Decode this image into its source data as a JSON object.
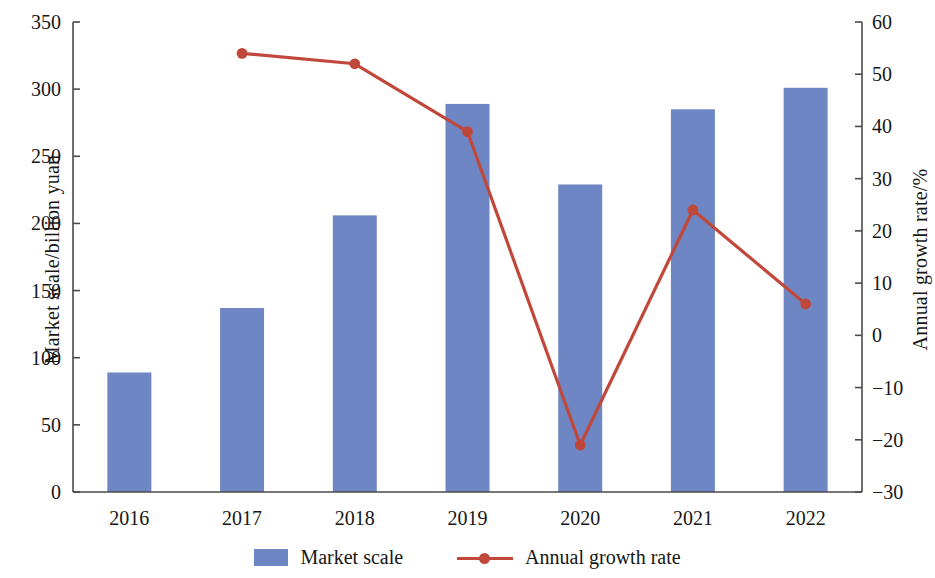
{
  "chart_data": {
    "type": "bar",
    "title": "",
    "subtitle": "",
    "categories": [
      "2016",
      "2017",
      "2018",
      "2019",
      "2020",
      "2021",
      "2022"
    ],
    "xlabel": "",
    "series": [
      {
        "name": "Market scale",
        "type": "bar",
        "axis": "left",
        "color": "#6f86c4",
        "values": [
          89,
          137,
          206,
          289,
          229,
          285,
          301
        ]
      },
      {
        "name": "Annual growth rate",
        "type": "line",
        "axis": "right",
        "color": "#c0483a",
        "values": [
          null,
          54,
          52,
          39,
          -21,
          24,
          6
        ]
      }
    ],
    "left_axis": {
      "label": "Market scale/billion yuan",
      "ticks": [
        "0",
        "50",
        "100",
        "150",
        "200",
        "250",
        "300",
        "350"
      ],
      "tick_values": [
        0,
        50,
        100,
        150,
        200,
        250,
        300,
        350
      ],
      "ylim": [
        0,
        350
      ]
    },
    "right_axis": {
      "label": "Annual growth rate/%",
      "ticks": [
        "−30",
        "−20",
        "−10",
        "0",
        "10",
        "20",
        "30",
        "40",
        "50",
        "60"
      ],
      "tick_values": [
        -30,
        -20,
        -10,
        0,
        10,
        20,
        30,
        40,
        50,
        60
      ],
      "ylim": [
        -30,
        60
      ]
    },
    "grid": false,
    "legend_position": "bottom",
    "legend": [
      {
        "label": "Market scale",
        "marker": "bar-swatch",
        "color": "#6f86c4"
      },
      {
        "label": "Annual growth rate",
        "marker": "line-with-dot",
        "color": "#c0483a"
      }
    ]
  }
}
